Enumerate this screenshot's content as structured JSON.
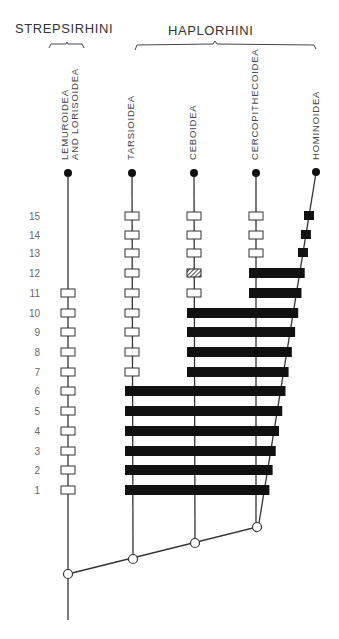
{
  "groups": [
    {
      "name": "STREPSIRHINI",
      "brace": [
        49,
        84
      ]
    },
    {
      "name": "HAPLORHINI",
      "brace": [
        135,
        316
      ]
    }
  ],
  "taxa": [
    {
      "id": "lemur",
      "label1": "LEMUROIDEA",
      "label2": "AND LORISOIDEA",
      "x": 68
    },
    {
      "id": "tarsier",
      "label1": "TARSIOIDEA",
      "x": 132
    },
    {
      "id": "ceboid",
      "label1": "CEBOIDEA",
      "x": 194
    },
    {
      "id": "cerco",
      "label1": "CERCOPITHECOIDEA",
      "x": 256
    },
    {
      "id": "homin",
      "label1": "HOMINOIDEA",
      "x": 316
    }
  ],
  "rows": [
    {
      "n": "15",
      "y": 216
    },
    {
      "n": "14",
      "y": 235
    },
    {
      "n": "13",
      "y": 253
    },
    {
      "n": "12",
      "y": 273
    },
    {
      "n": "11",
      "y": 293
    },
    {
      "n": "10",
      "y": 313
    },
    {
      "n": "9",
      "y": 332
    },
    {
      "n": "8",
      "y": 352
    },
    {
      "n": "7",
      "y": 372
    },
    {
      "n": "6",
      "y": 391
    },
    {
      "n": "5",
      "y": 411
    },
    {
      "n": "4",
      "y": 431
    },
    {
      "n": "3",
      "y": 451
    },
    {
      "n": "2",
      "y": 470
    },
    {
      "n": "1",
      "y": 490
    }
  ],
  "legend_notes": {
    "open_box": "taxon recognized as separate group",
    "black_bar": "taxa grouped together",
    "hatched_box": "uncertain/partial grouping"
  },
  "chart_data": {
    "type": "diagram",
    "title": "",
    "group_labels": [
      "STREPSIRHINI",
      "HAPLORHINI"
    ],
    "taxa": [
      "LEMUROIDEA AND LORISOIDEA",
      "TARSIOIDEA",
      "CEBOIDEA",
      "CERCOPITHECOIDEA",
      "HOMINOIDEA"
    ],
    "row_labels": [
      "15",
      "14",
      "13",
      "12",
      "11",
      "10",
      "9",
      "8",
      "7",
      "6",
      "5",
      "4",
      "3",
      "2",
      "1"
    ],
    "bars": [
      {
        "row": "12",
        "from": "CERCOPITHECOIDEA",
        "to": "HOMINOIDEA",
        "ceboid_marker": "hatched"
      },
      {
        "row": "11",
        "from": "CERCOPITHECOIDEA",
        "to": "HOMINOIDEA"
      },
      {
        "row": "10",
        "from": "CEBOIDEA",
        "to": "HOMINOIDEA"
      },
      {
        "row": "9",
        "from": "CEBOIDEA",
        "to": "HOMINOIDEA"
      },
      {
        "row": "8",
        "from": "CEBOIDEA",
        "to": "HOMINOIDEA"
      },
      {
        "row": "7",
        "from": "CEBOIDEA",
        "to": "HOMINOIDEA"
      },
      {
        "row": "6",
        "from": "TARSIOIDEA",
        "to": "HOMINOIDEA"
      },
      {
        "row": "5",
        "from": "TARSIOIDEA",
        "to": "HOMINOIDEA"
      },
      {
        "row": "4",
        "from": "TARSIOIDEA",
        "to": "HOMINOIDEA"
      },
      {
        "row": "3",
        "from": "TARSIOIDEA",
        "to": "HOMINOIDEA"
      },
      {
        "row": "2",
        "from": "TARSIOIDEA",
        "to": "HOMINOIDEA"
      },
      {
        "row": "1",
        "from": "TARSIOIDEA",
        "to": "HOMINOIDEA"
      }
    ],
    "open_boxes": {
      "LEMUROIDEA AND LORISOIDEA": [
        "11",
        "10",
        "9",
        "8",
        "7",
        "6",
        "5",
        "4",
        "3",
        "2",
        "1"
      ],
      "TARSIOIDEA": [
        "15",
        "14",
        "13",
        "12",
        "11",
        "10",
        "9",
        "8",
        "7"
      ],
      "CEBOIDEA": [
        "15",
        "14",
        "13",
        "11"
      ],
      "CERCOPITHECOIDEA": [
        "15",
        "14",
        "13"
      ]
    },
    "filled_boxes": {
      "HOMINOIDEA": [
        "15",
        "14",
        "13"
      ]
    },
    "nodes": [
      [
        68,
        574
      ],
      [
        133,
        559
      ],
      [
        195,
        543
      ],
      [
        257,
        527
      ]
    ]
  }
}
